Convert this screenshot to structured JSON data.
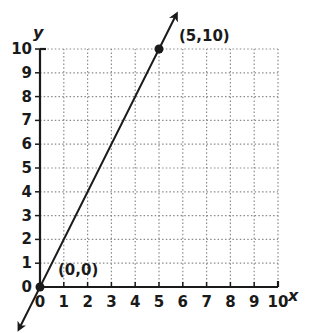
{
  "chart_data": {
    "type": "line",
    "title": "",
    "xlabel": "x",
    "ylabel": "y",
    "xlim": [
      0,
      10
    ],
    "ylim": [
      0,
      10
    ],
    "grid": true,
    "x_ticks": [
      "0",
      "1",
      "2",
      "3",
      "4",
      "5",
      "6",
      "7",
      "8",
      "9",
      "10"
    ],
    "y_ticks": [
      "0",
      "1",
      "2",
      "3",
      "4",
      "5",
      "6",
      "7",
      "8",
      "9",
      "10"
    ],
    "series": [
      {
        "name": "y = 2x",
        "x": [
          0,
          5
        ],
        "y": [
          0,
          10
        ],
        "arrows_both_ends": true
      }
    ],
    "points": [
      {
        "x": 0,
        "y": 0,
        "label": "(0,0)"
      },
      {
        "x": 5,
        "y": 10,
        "label": "(5,10)"
      }
    ],
    "annotations": [
      "(0,0)",
      "(5,10)"
    ]
  },
  "colors": {
    "line": "#1a1a1a",
    "grid": "#8a8a8a",
    "background": "#ffffff"
  }
}
